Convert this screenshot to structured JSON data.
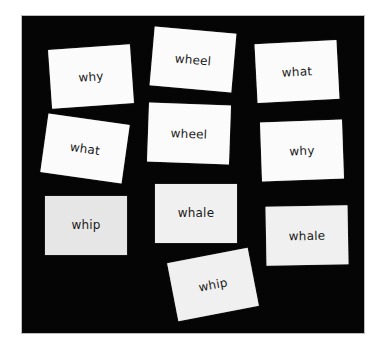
{
  "scene": {
    "description": "Word flash cards on black background",
    "board_color": "#050505",
    "card_color": "#fbfbfb",
    "text_color": "#1a1a1a"
  },
  "cards": [
    {
      "word": "why",
      "cx": 91,
      "cy": 76,
      "rotate": -4
    },
    {
      "word": "wheel",
      "cx": 193,
      "cy": 59,
      "rotate": 5
    },
    {
      "word": "what",
      "cx": 297,
      "cy": 71,
      "rotate": -3
    },
    {
      "word": "what",
      "cx": 85,
      "cy": 148,
      "rotate": 8
    },
    {
      "word": "wheel",
      "cx": 189,
      "cy": 133,
      "rotate": 2
    },
    {
      "word": "why",
      "cx": 302,
      "cy": 150,
      "rotate": -2
    },
    {
      "word": "whip",
      "cx": 86,
      "cy": 225,
      "rotate": 0
    },
    {
      "word": "whale",
      "cx": 196,
      "cy": 213,
      "rotate": 0
    },
    {
      "word": "whale",
      "cx": 307,
      "cy": 235,
      "rotate": -1
    },
    {
      "word": "whip",
      "cx": 213,
      "cy": 284,
      "rotate": -11
    }
  ]
}
